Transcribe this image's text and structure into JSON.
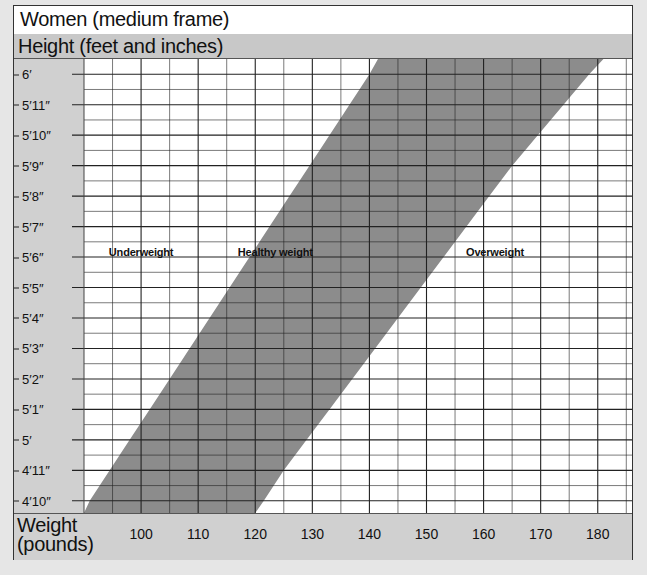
{
  "title": "Women (medium frame)",
  "y_axis_title": "Height (feet and inches)",
  "x_axis_title_line1": "Weight",
  "x_axis_title_line2": "(pounds)",
  "x_ticks": [
    {
      "label": "100",
      "value": 100
    },
    {
      "label": "110",
      "value": 110
    },
    {
      "label": "120",
      "value": 120
    },
    {
      "label": "130",
      "value": 130
    },
    {
      "label": "140",
      "value": 140
    },
    {
      "label": "150",
      "value": 150
    },
    {
      "label": "160",
      "value": 160
    },
    {
      "label": "170",
      "value": 170
    },
    {
      "label": "180",
      "value": 180
    }
  ],
  "y_ticks": [
    {
      "label": "6′",
      "inches": 72
    },
    {
      "label": "5′11″",
      "inches": 71
    },
    {
      "label": "5′10″",
      "inches": 70
    },
    {
      "label": "5′9″",
      "inches": 69
    },
    {
      "label": "5′8″",
      "inches": 68
    },
    {
      "label": "5′7″",
      "inches": 67
    },
    {
      "label": "5′6″",
      "inches": 66
    },
    {
      "label": "5′5″",
      "inches": 65
    },
    {
      "label": "5′4″",
      "inches": 64
    },
    {
      "label": "5′3″",
      "inches": 63
    },
    {
      "label": "5′2″",
      "inches": 62
    },
    {
      "label": "5′1″",
      "inches": 61
    },
    {
      "label": "5′",
      "inches": 60
    },
    {
      "label": "4′11″",
      "inches": 59
    },
    {
      "label": "4′10″",
      "inches": 58
    }
  ],
  "regions": {
    "underweight": "Underweight",
    "healthy": "Healthy weight",
    "overweight": "Overweight"
  },
  "colors": {
    "healthy_band": "#8c8c8c",
    "grid": "#222222",
    "background": "#ffffff",
    "panel": "#d0d0d0"
  },
  "chart_data": {
    "type": "area",
    "title": "Women (medium frame)",
    "xlabel": "Weight (pounds)",
    "ylabel": "Height (feet and inches)",
    "xlim": [
      90,
      186
    ],
    "ylim_inches": [
      57.6,
      72.5
    ],
    "grid": true,
    "x_tick_labels": [
      "100",
      "110",
      "120",
      "130",
      "140",
      "150",
      "160",
      "170",
      "180"
    ],
    "y_tick_labels": [
      "6′",
      "5′11″",
      "5′10″",
      "5′9″",
      "5′8″",
      "5′7″",
      "5′6″",
      "5′5″",
      "5′4″",
      "5′3″",
      "5′2″",
      "5′1″",
      "5′",
      "4′11″",
      "4′10″"
    ],
    "annotations": [
      "Underweight",
      "Healthy weight",
      "Overweight"
    ],
    "series": [
      {
        "name": "Healthy weight lower bound",
        "heights_in": [
          57.6,
          58,
          59,
          60,
          61,
          62,
          63,
          64,
          65,
          66,
          67,
          68,
          69,
          70,
          71,
          72,
          72.5
        ],
        "weights_lb": [
          90,
          91,
          94.5,
          98,
          101.5,
          105,
          108.5,
          112,
          115.5,
          119,
          122.5,
          126,
          129.5,
          133,
          136.5,
          140,
          141.5
        ]
      },
      {
        "name": "Healthy weight upper bound",
        "heights_in": [
          57.6,
          58,
          59,
          60,
          61,
          62,
          63,
          64,
          65,
          66,
          67,
          68,
          69,
          70,
          71,
          72,
          72.5
        ],
        "weights_lb": [
          120,
          121.5,
          125,
          129,
          133,
          137,
          141,
          145,
          149,
          153,
          157,
          161,
          165,
          169.5,
          174,
          178.5,
          181
        ]
      }
    ]
  }
}
